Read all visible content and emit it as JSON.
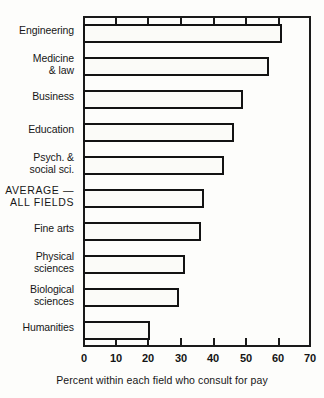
{
  "chart_data": {
    "type": "bar",
    "orientation": "horizontal",
    "title": "",
    "xlabel": "Percent within each field who consult for pay",
    "ylabel": "",
    "xlim": [
      0,
      70
    ],
    "xticks": [
      0,
      10,
      20,
      30,
      40,
      50,
      60,
      70
    ],
    "xtick_labels": [
      "0",
      "10",
      "20",
      "30",
      "40",
      "50",
      "60",
      "70"
    ],
    "grid": false,
    "legend": null,
    "categories": [
      "Engineering",
      "Medicine\n& law",
      "Business",
      "Education",
      "Psych. &\nsocial sci.",
      "AVERAGE —\nALL FIELDS",
      "Fine arts",
      "Physical\nsciences",
      "Biological\nsciences",
      "Humanities"
    ],
    "values": [
      61,
      57,
      49,
      46,
      43,
      37,
      36,
      31,
      29,
      20
    ],
    "bar_face_color": "#fbfbf8",
    "bar_edge_color": "#131313",
    "frame_color": "#1a1a1a",
    "background_color": "#fdfdfb"
  }
}
